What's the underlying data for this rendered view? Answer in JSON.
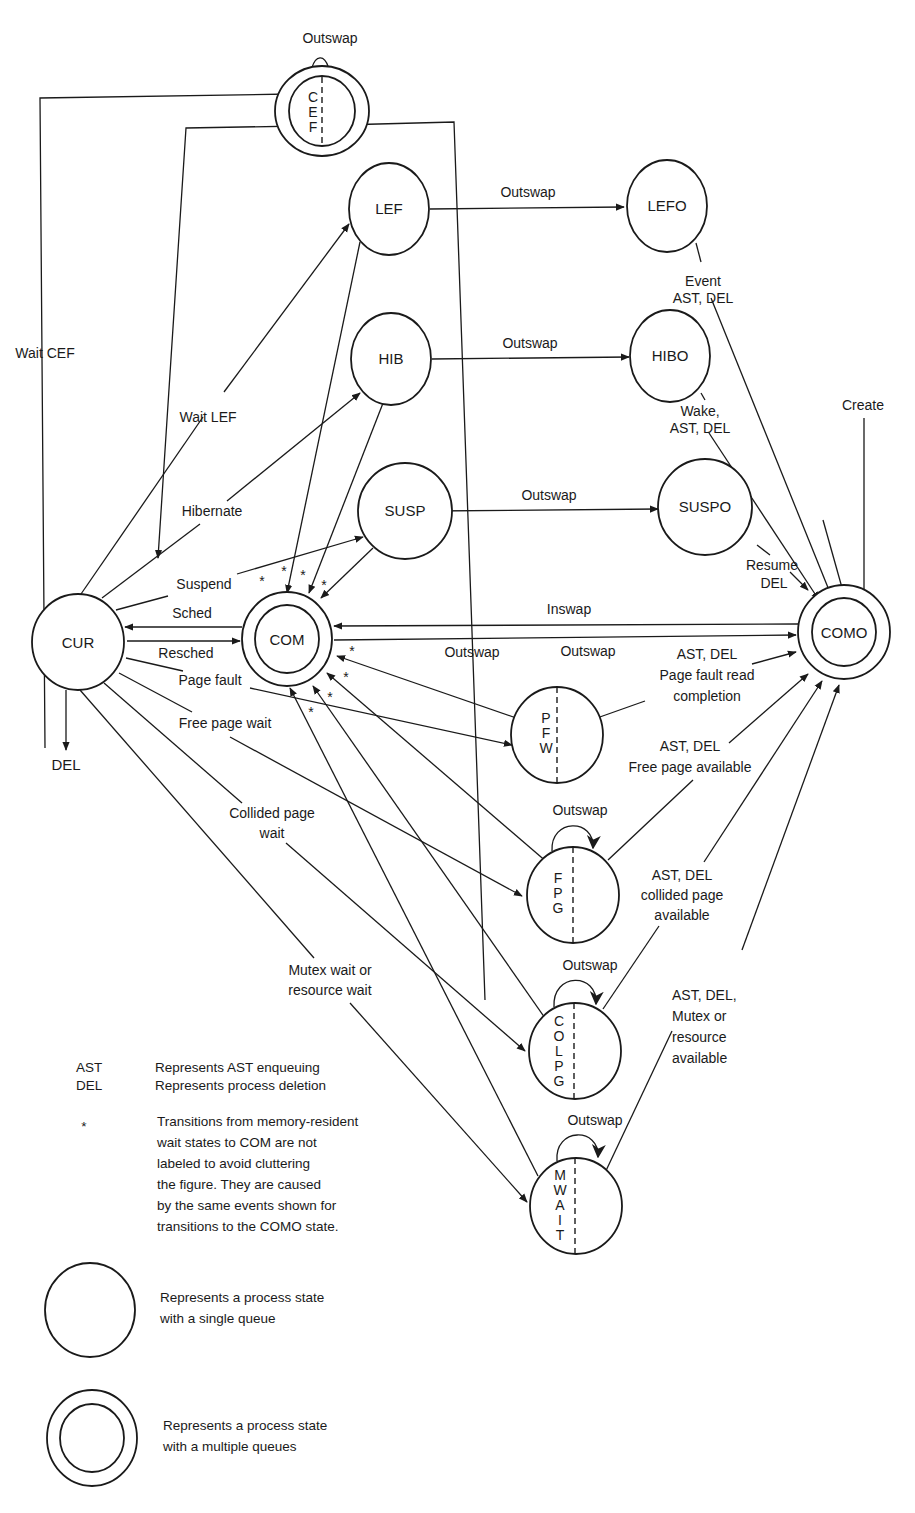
{
  "diagram": {
    "states": {
      "cef": {
        "label": "CEF",
        "letters": [
          "C",
          "E",
          "F"
        ],
        "type": "multiple-queue"
      },
      "lef": {
        "label": "LEF",
        "type": "single-queue"
      },
      "lefo": {
        "label": "LEFO",
        "type": "single-queue"
      },
      "hib": {
        "label": "HIB",
        "type": "single-queue"
      },
      "hibo": {
        "label": "HIBO",
        "type": "single-queue"
      },
      "susp": {
        "label": "SUSP",
        "type": "single-queue"
      },
      "suspo": {
        "label": "SUSPO",
        "type": "single-queue"
      },
      "cur": {
        "label": "CUR",
        "type": "single-queue"
      },
      "com": {
        "label": "COM",
        "type": "multiple-queue"
      },
      "como": {
        "label": "COMO",
        "type": "multiple-queue"
      },
      "pfw": {
        "label": "PFW",
        "letters": [
          "P",
          "F",
          "W"
        ],
        "type": "single-queue"
      },
      "fpg": {
        "label": "FPG",
        "letters": [
          "F",
          "P",
          "G"
        ],
        "type": "single-queue"
      },
      "colpg": {
        "label": "COLPG",
        "letters": [
          "C",
          "O",
          "L",
          "P",
          "G"
        ],
        "type": "single-queue"
      },
      "mwait": {
        "label": "MWAIT",
        "letters": [
          "M",
          "W",
          "A",
          "I",
          "T"
        ],
        "type": "single-queue"
      },
      "del": {
        "label": "DEL"
      }
    },
    "edges": {
      "cef_self": "Outswap",
      "lef_lefo": "Outswap",
      "hib_hibo": "Outswap",
      "susp_suspo": "Outswap",
      "lefo_como": [
        "Event",
        "AST, DEL"
      ],
      "hibo_como": [
        "Wake,",
        "AST, DEL"
      ],
      "suspo_como": [
        "Resume",
        "DEL"
      ],
      "create": "Create",
      "wait_cef": "Wait CEF",
      "wait_lef": "Wait LEF",
      "hibernate": "Hibernate",
      "suspend": "Suspend",
      "sched": "Sched",
      "resched": "Resched",
      "page_fault": "Page fault",
      "free_page_wait": "Free page wait",
      "collided_page_wait": [
        "Collided page",
        "wait"
      ],
      "mutex_wait": [
        "Mutex wait or",
        "resource wait"
      ],
      "inswap": "Inswap",
      "com_como_outswap": "Outswap",
      "pfw_self": "Outswap",
      "fpg_self": "Outswap",
      "colpg_self": "Outswap",
      "mwait_self": "Outswap",
      "pfw_como": [
        "AST, DEL",
        "Page fault read",
        "completion"
      ],
      "fpg_como": [
        "AST, DEL",
        "Free page available"
      ],
      "colpg_como": [
        "AST, DEL",
        "collided page",
        "available"
      ],
      "mwait_como": [
        "AST, DEL,",
        "Mutex or",
        "resource",
        "available"
      ],
      "star": "*"
    },
    "legend": {
      "ast_key": "AST",
      "ast_desc": "Represents AST enqueuing",
      "del_key": "DEL",
      "del_desc": "Represents process deletion",
      "star_key": "*",
      "star_desc": [
        "Transitions from memory-resident",
        "wait states to COM are not",
        "labeled to avoid cluttering",
        "the figure. They are caused",
        "by the same events shown for",
        "transitions to the COMO state."
      ],
      "single_desc": [
        "Represents a process state",
        "with a single queue"
      ],
      "multiple_desc": [
        "Represents a process state",
        "with a multiple queues"
      ]
    }
  }
}
